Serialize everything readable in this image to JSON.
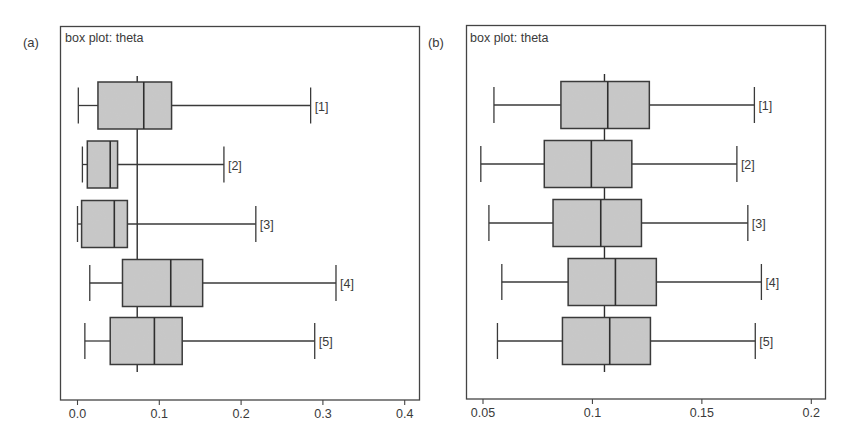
{
  "figure": {
    "panels": [
      {
        "label": "(a)",
        "title": "box plot: theta"
      },
      {
        "label": "(b)",
        "title": "box plot: theta"
      }
    ]
  },
  "colors": {
    "box_fill": "#c8c8c8",
    "stroke": "#3a3a3a",
    "frame": "#444444",
    "text": "#3a3a3a"
  },
  "chart_data": [
    {
      "type": "boxplot",
      "panel_label": "(a)",
      "title": "box plot: theta",
      "orientation": "horizontal",
      "xlabel": "",
      "ylabel": "",
      "xlim": [
        -0.02,
        0.41
      ],
      "xticks": [
        0.0,
        0.1,
        0.2,
        0.3,
        0.4
      ],
      "xtick_labels": [
        "0.0",
        "0.1",
        "0.2",
        "0.3",
        "0.4"
      ],
      "reference_line": 0.073,
      "grid": false,
      "categories": [
        "[1]",
        "[2]",
        "[3]",
        "[4]",
        "[5]"
      ],
      "boxes": [
        {
          "label": "[1]",
          "whisker_low": 0.001,
          "q1": 0.025,
          "median": 0.081,
          "q3": 0.115,
          "whisker_high": 0.285
        },
        {
          "label": "[2]",
          "whisker_low": 0.006,
          "q1": 0.012,
          "median": 0.04,
          "q3": 0.049,
          "whisker_high": 0.179
        },
        {
          "label": "[3]",
          "whisker_low": 0.0,
          "q1": 0.005,
          "median": 0.045,
          "q3": 0.061,
          "whisker_high": 0.218
        },
        {
          "label": "[4]",
          "whisker_low": 0.015,
          "q1": 0.055,
          "median": 0.114,
          "q3": 0.153,
          "whisker_high": 0.316
        },
        {
          "label": "[5]",
          "whisker_low": 0.009,
          "q1": 0.04,
          "median": 0.094,
          "q3": 0.128,
          "whisker_high": 0.29
        }
      ]
    },
    {
      "type": "boxplot",
      "panel_label": "(b)",
      "title": "box plot: theta",
      "orientation": "horizontal",
      "xlabel": "",
      "ylabel": "",
      "xlim": [
        0.0445,
        0.2065
      ],
      "xticks": [
        0.05,
        0.1,
        0.15,
        0.2
      ],
      "xtick_labels": [
        "0.05",
        "0.1",
        "0.15",
        "0.2"
      ],
      "reference_line": 0.1055,
      "grid": false,
      "categories": [
        "[1]",
        "[2]",
        "[3]",
        "[4]",
        "[5]"
      ],
      "boxes": [
        {
          "label": "[1]",
          "whisker_low": 0.055,
          "q1": 0.0856,
          "median": 0.107,
          "q3": 0.126,
          "whisker_high": 0.174
        },
        {
          "label": "[2]",
          "whisker_low": 0.049,
          "q1": 0.078,
          "median": 0.0995,
          "q3": 0.118,
          "whisker_high": 0.166
        },
        {
          "label": "[3]",
          "whisker_low": 0.0527,
          "q1": 0.082,
          "median": 0.1038,
          "q3": 0.1224,
          "whisker_high": 0.171
        },
        {
          "label": "[4]",
          "whisker_low": 0.0586,
          "q1": 0.0889,
          "median": 0.1105,
          "q3": 0.1292,
          "whisker_high": 0.1772
        },
        {
          "label": "[5]",
          "whisker_low": 0.0566,
          "q1": 0.0863,
          "median": 0.1079,
          "q3": 0.1265,
          "whisker_high": 0.1744
        }
      ]
    }
  ]
}
